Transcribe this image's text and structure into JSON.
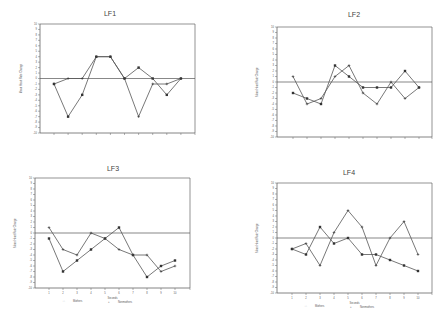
{
  "chart_data": [
    {
      "type": "line",
      "title": "LF1",
      "xlabel": "",
      "ylabel": "Mean Heart Rate Change",
      "x": [
        1,
        2,
        3,
        4,
        5,
        6,
        7,
        8,
        9,
        10
      ],
      "ylim": [
        -10,
        10
      ],
      "yticks": [
        10,
        9,
        8,
        7,
        6,
        5,
        4,
        3,
        2,
        1,
        0,
        -1,
        -2,
        -3,
        -4,
        -5,
        -6,
        -7,
        -8,
        -9,
        -10
      ],
      "grid": false,
      "zero_line": true,
      "show_x_tick_labels": false,
      "show_legend": false,
      "series": [
        {
          "name": "Mothers",
          "marker": "square",
          "values": [
            -1,
            -7,
            -3,
            4,
            4,
            0,
            2,
            0,
            -3,
            0
          ]
        },
        {
          "name": "Nonmothers",
          "marker": "plus",
          "values": [
            -1,
            0,
            0,
            4,
            4,
            0,
            -7,
            -1,
            -1,
            0
          ]
        }
      ]
    },
    {
      "type": "line",
      "title": "LF2",
      "xlabel": "",
      "ylabel": "Mean Heart Rate Change",
      "x": [
        1,
        2,
        3,
        4,
        5,
        6,
        7,
        8,
        9,
        10
      ],
      "ylim": [
        -10,
        10
      ],
      "yticks": [
        10,
        9,
        8,
        7,
        6,
        5,
        4,
        3,
        2,
        1,
        0,
        -1,
        -2,
        -3,
        -4,
        -5,
        -6,
        -7,
        -8,
        -9,
        -10
      ],
      "grid": false,
      "zero_line": true,
      "show_x_tick_labels": false,
      "show_legend": false,
      "series": [
        {
          "name": "Mothers",
          "marker": "square",
          "values": [
            -2,
            -3,
            -4,
            3,
            1,
            -1,
            -1,
            -1,
            2,
            -1
          ]
        },
        {
          "name": "Nonmothers",
          "marker": "plus",
          "values": [
            1,
            -4,
            -3,
            1,
            3,
            -2,
            -4,
            0,
            -3,
            -1
          ]
        }
      ]
    },
    {
      "type": "line",
      "title": "LF3",
      "xlabel": "Seconds",
      "ylabel": "Mean Heart Rate Change",
      "x": [
        1,
        2,
        3,
        4,
        5,
        6,
        7,
        8,
        9,
        10
      ],
      "ylim": [
        -10,
        10
      ],
      "yticks": [
        10,
        9,
        8,
        7,
        6,
        5,
        4,
        3,
        2,
        1,
        0,
        -1,
        -2,
        -3,
        -4,
        -5,
        -6,
        -7,
        -8,
        -9,
        -10
      ],
      "grid": false,
      "zero_line": true,
      "show_x_tick_labels": true,
      "show_legend": true,
      "legend_position": "bottom",
      "series": [
        {
          "name": "Mothers",
          "marker": "square",
          "values": [
            -1,
            -7,
            -5,
            -3,
            -1,
            1,
            -4,
            -8,
            -6,
            -5
          ]
        },
        {
          "name": "Nonmothers",
          "marker": "plus",
          "values": [
            1,
            -3,
            -4,
            0,
            -1,
            -3,
            -4,
            -4,
            -7,
            -6
          ]
        }
      ]
    },
    {
      "type": "line",
      "title": "LF4",
      "xlabel": "Seconds",
      "ylabel": "Mean Heart Rate Change",
      "x": [
        1,
        2,
        3,
        4,
        5,
        6,
        7,
        8,
        9,
        10
      ],
      "ylim": [
        -10,
        10
      ],
      "yticks": [
        10,
        9,
        8,
        7,
        6,
        5,
        4,
        3,
        2,
        1,
        0,
        -1,
        -2,
        -3,
        -4,
        -5,
        -6,
        -7,
        -8,
        -9,
        -10
      ],
      "grid": false,
      "zero_line": true,
      "show_x_tick_labels": true,
      "show_legend": true,
      "legend_position": "bottom",
      "series": [
        {
          "name": "Mothers",
          "marker": "square",
          "values": [
            -2,
            -3,
            2,
            -1,
            0,
            -3,
            -3,
            -4,
            -5,
            -6
          ]
        },
        {
          "name": "Nonmothers",
          "marker": "plus",
          "values": [
            -2,
            -1,
            -5,
            1,
            5,
            2,
            -5,
            0,
            3,
            -3
          ]
        }
      ]
    }
  ],
  "legend": {
    "mothers_symbol": "□",
    "mothers_label": "Mothers",
    "nonmothers_symbol": "+",
    "nonmothers_label": "Nonmothers"
  },
  "colors": {
    "line": "#555555",
    "axis": "#666666",
    "zero_line": "#555555"
  }
}
